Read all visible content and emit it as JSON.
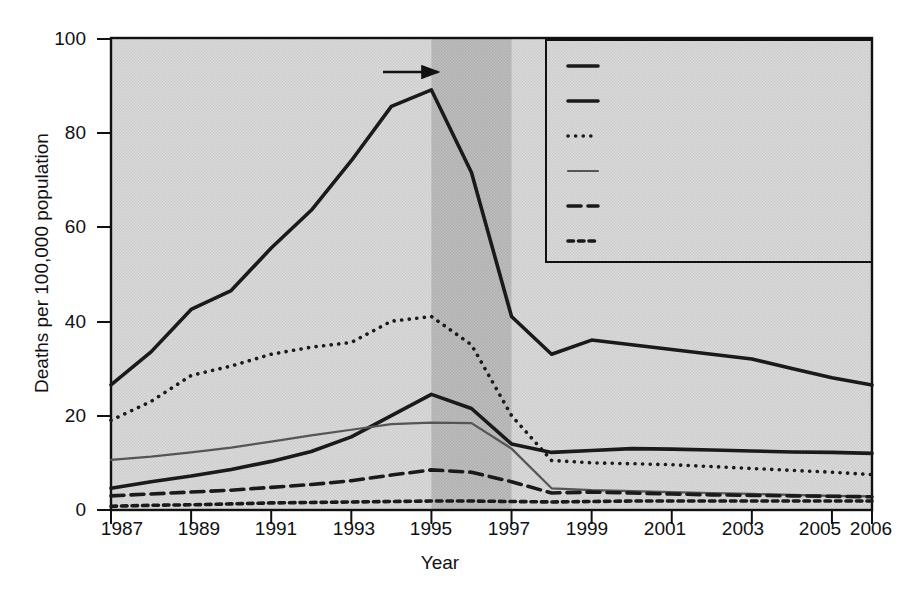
{
  "chart_data": {
    "type": "line",
    "title": "",
    "xlabel": "Year",
    "ylabel": "Deaths per 100,000 population",
    "xlim": [
      1987,
      2006
    ],
    "ylim": [
      0,
      100
    ],
    "ytickvals": [
      0,
      20,
      40,
      60,
      80,
      100
    ],
    "yticklabels": [
      "0",
      "20",
      "40",
      "60",
      "80",
      "100"
    ],
    "xtickvals": [
      1987,
      1989,
      1991,
      1993,
      1995,
      1997,
      1999,
      2001,
      2003,
      2005,
      2006
    ],
    "xticklabels": [
      "1987",
      "1989",
      "1991",
      "1993",
      "1995",
      "1997",
      "1999",
      "2001",
      "2003",
      "2005",
      "2006"
    ],
    "grid": false,
    "legend_position": "top-right",
    "x": [
      1987,
      1988,
      1989,
      1990,
      1991,
      1992,
      1993,
      1994,
      1995,
      1996,
      1997,
      1998,
      1999,
      2000,
      2001,
      2002,
      2003,
      2004,
      2005,
      2006
    ],
    "series": [
      {
        "name": "Black male",
        "style": "solid-thick",
        "color": "#1a1a1a",
        "values": [
          26.5,
          33.5,
          42.5,
          46.5,
          55.5,
          63.5,
          74.0,
          85.5,
          89.0,
          71.5,
          41.0,
          33.0,
          36.0,
          35.0,
          34.0,
          33.0,
          32.0,
          30.0,
          28.0,
          26.5
        ]
      },
      {
        "name": "Black female",
        "style": "solid-thick",
        "color": "#1a1a1a",
        "values": [
          4.6,
          6.0,
          7.2,
          8.6,
          10.3,
          12.4,
          15.5,
          20.0,
          24.5,
          21.5,
          14.0,
          12.2,
          12.6,
          13.0,
          12.9,
          12.7,
          12.5,
          12.3,
          12.2,
          12.0
        ]
      },
      {
        "name": "Hispanic male",
        "style": "dotted",
        "color": "#1a1a1a",
        "values": [
          19.0,
          23.0,
          28.5,
          30.5,
          33.0,
          34.5,
          35.5,
          40.0,
          41.0,
          35.0,
          20.0,
          10.5,
          10.0,
          9.8,
          9.6,
          9.2,
          8.8,
          8.4,
          8.0,
          7.5
        ]
      },
      {
        "name": "White, not Hispanic male",
        "style": "solid-thin",
        "color": "#555555",
        "values": [
          10.6,
          11.3,
          12.2,
          13.2,
          14.5,
          15.8,
          17.0,
          18.2,
          18.5,
          18.4,
          13.0,
          4.6,
          4.2,
          4.0,
          3.8,
          3.6,
          3.4,
          3.2,
          3.0,
          2.9
        ]
      },
      {
        "name": "Hispanic female",
        "style": "dashed-long",
        "color": "#1a1a1a",
        "values": [
          3.0,
          3.4,
          3.8,
          4.2,
          4.8,
          5.4,
          6.2,
          7.4,
          8.5,
          8.0,
          6.0,
          3.6,
          3.8,
          3.6,
          3.4,
          3.2,
          3.1,
          3.0,
          2.9,
          2.8
        ]
      },
      {
        "name": "White, not Hispanic female",
        "style": "dashed-short",
        "color": "#1a1a1a",
        "values": [
          0.8,
          1.0,
          1.1,
          1.3,
          1.5,
          1.6,
          1.7,
          1.8,
          1.9,
          1.9,
          1.8,
          1.7,
          1.8,
          1.9,
          1.9,
          1.9,
          1.9,
          1.9,
          1.9,
          1.9
        ]
      }
    ],
    "shaded_band": {
      "from": 1995,
      "to": 1997,
      "label": ""
    },
    "annotations": [
      {
        "name": "haart-annotation",
        "line1": "HAART introduced",
        "line2": "into U.S. population",
        "arrow": "right-arrow"
      }
    ]
  }
}
